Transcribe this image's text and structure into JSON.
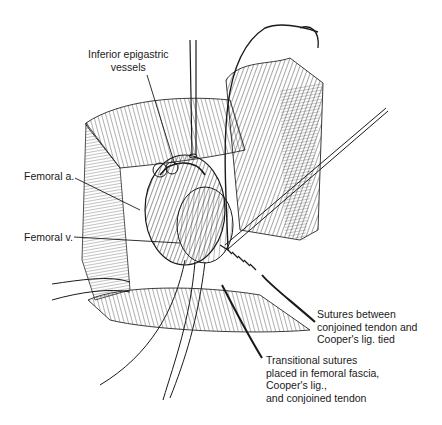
{
  "figure": {
    "type": "surgical-illustration",
    "style": "black-and-white line drawing",
    "colors": {
      "ink": "#1a1a1a",
      "background": "#ffffff"
    }
  },
  "labels": {
    "inferior_epigastric": "Inferior epigastric\nvessels",
    "femoral_artery": "Femoral a.",
    "femoral_vein": "Femoral v.",
    "sutures_tied": "Sutures between\nconjoined tendon and\nCooper's lig. tied",
    "transitional_sutures": "Transitional sutures\nplaced in femoral fascia,\nCooper's lig.,\nand conjoined tendon"
  }
}
